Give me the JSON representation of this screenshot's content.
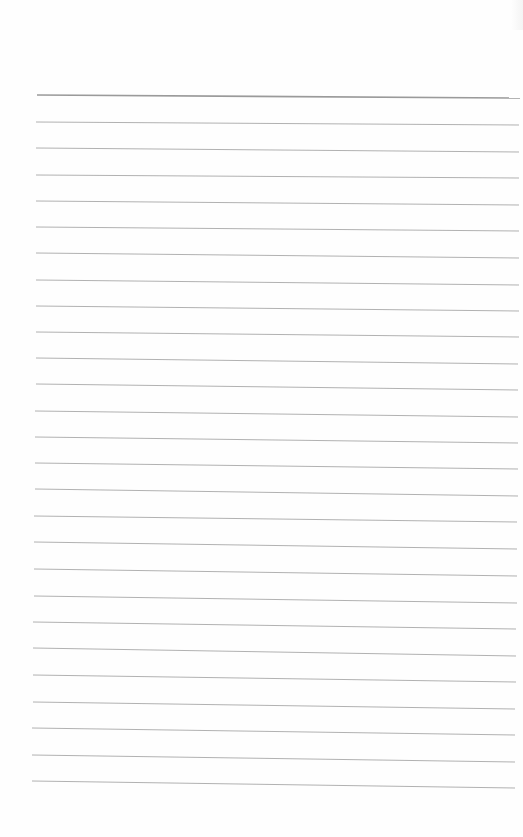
{
  "page": {
    "type": "lined-paper",
    "background": "#fefefe",
    "line_color": "#a8a8a8",
    "header_line_color": "#9a9a9a",
    "line_count": 27,
    "line_spacing_px": 26.3,
    "text_content": ""
  },
  "lines": [
    {
      "y_left": 95,
      "y_right": 98,
      "x_left": 37,
      "x_right": 520,
      "weight": 1.6
    },
    {
      "y_left": 122,
      "y_right": 125,
      "x_left": 36,
      "x_right": 519,
      "weight": 0.9
    },
    {
      "y_left": 148,
      "y_right": 152,
      "x_left": 36,
      "x_right": 519,
      "weight": 0.9
    },
    {
      "y_left": 175,
      "y_right": 178,
      "x_left": 36,
      "x_right": 519,
      "weight": 0.9
    },
    {
      "y_left": 201,
      "y_right": 205,
      "x_left": 36,
      "x_right": 519,
      "weight": 0.9
    },
    {
      "y_left": 227,
      "y_right": 231,
      "x_left": 36,
      "x_right": 519,
      "weight": 0.9
    },
    {
      "y_left": 253,
      "y_right": 258,
      "x_left": 36,
      "x_right": 519,
      "weight": 0.9
    },
    {
      "y_left": 280,
      "y_right": 285,
      "x_left": 36,
      "x_right": 519,
      "weight": 0.9
    },
    {
      "y_left": 306,
      "y_right": 311,
      "x_left": 36,
      "x_right": 519,
      "weight": 0.9
    },
    {
      "y_left": 332,
      "y_right": 337,
      "x_left": 36,
      "x_right": 519,
      "weight": 0.9
    },
    {
      "y_left": 358,
      "y_right": 364,
      "x_left": 36,
      "x_right": 518,
      "weight": 0.9
    },
    {
      "y_left": 384,
      "y_right": 390,
      "x_left": 36,
      "x_right": 518,
      "weight": 0.9
    },
    {
      "y_left": 411,
      "y_right": 417,
      "x_left": 35,
      "x_right": 518,
      "weight": 0.9
    },
    {
      "y_left": 437,
      "y_right": 443,
      "x_left": 35,
      "x_right": 518,
      "weight": 0.9
    },
    {
      "y_left": 463,
      "y_right": 469,
      "x_left": 35,
      "x_right": 518,
      "weight": 0.9
    },
    {
      "y_left": 489,
      "y_right": 496,
      "x_left": 35,
      "x_right": 518,
      "weight": 0.9
    },
    {
      "y_left": 516,
      "y_right": 522,
      "x_left": 34,
      "x_right": 517,
      "weight": 0.9
    },
    {
      "y_left": 542,
      "y_right": 549,
      "x_left": 34,
      "x_right": 517,
      "weight": 0.9
    },
    {
      "y_left": 569,
      "y_right": 576,
      "x_left": 34,
      "x_right": 517,
      "weight": 0.9
    },
    {
      "y_left": 596,
      "y_right": 603,
      "x_left": 34,
      "x_right": 517,
      "weight": 0.9
    },
    {
      "y_left": 622,
      "y_right": 629,
      "x_left": 33,
      "x_right": 516,
      "weight": 0.9
    },
    {
      "y_left": 648,
      "y_right": 656,
      "x_left": 33,
      "x_right": 516,
      "weight": 0.9
    },
    {
      "y_left": 675,
      "y_right": 682,
      "x_left": 33,
      "x_right": 516,
      "weight": 0.9
    },
    {
      "y_left": 702,
      "y_right": 709,
      "x_left": 33,
      "x_right": 515,
      "weight": 0.9
    },
    {
      "y_left": 728,
      "y_right": 735,
      "x_left": 32,
      "x_right": 515,
      "weight": 0.9
    },
    {
      "y_left": 755,
      "y_right": 762,
      "x_left": 32,
      "x_right": 515,
      "weight": 0.9
    },
    {
      "y_left": 781,
      "y_right": 788,
      "x_left": 32,
      "x_right": 515,
      "weight": 0.9
    }
  ]
}
